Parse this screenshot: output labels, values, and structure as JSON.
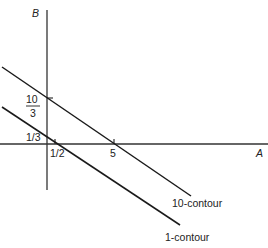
{
  "diagram": {
    "axes": {
      "x_label": "A",
      "y_label": "B"
    },
    "tick_labels": {
      "x_half": "1/2",
      "x_five": "5",
      "y_third": "1/3",
      "y_ten_thirds_num": "10",
      "y_ten_thirds_den": "3"
    },
    "contours": [
      {
        "label": "10-contour",
        "a_intercept": "5",
        "b_intercept": "10/3"
      },
      {
        "label": "1-contour",
        "a_intercept": "1/2",
        "b_intercept": "1/3"
      }
    ],
    "colors": {
      "line": "#1a1a1a",
      "axis": "#333333",
      "text": "#222222"
    }
  }
}
